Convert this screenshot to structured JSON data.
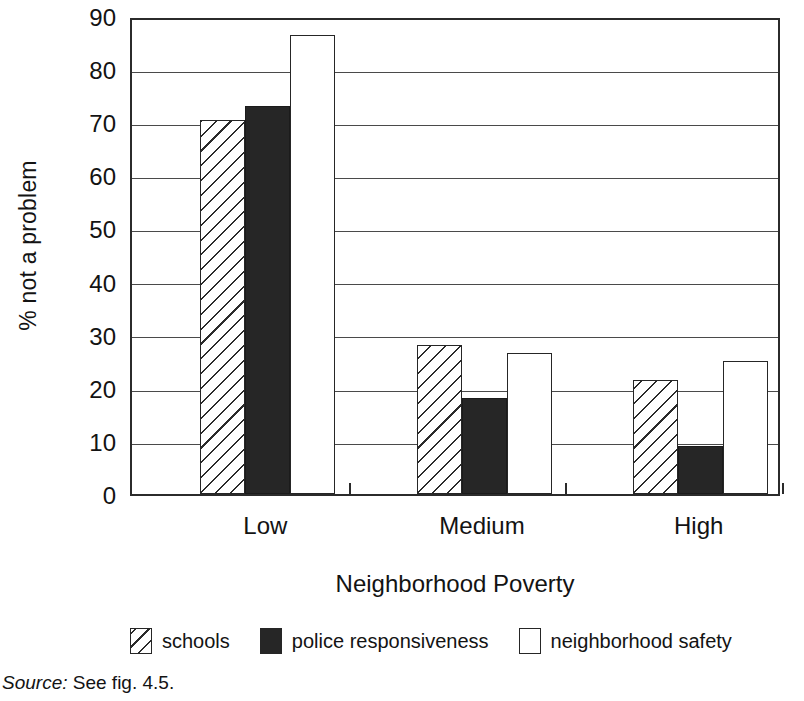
{
  "figure": {
    "source_note_label": "Source:",
    "source_note_text": "See fig. 4.5."
  },
  "chart_data": {
    "type": "bar",
    "title": "",
    "subtitle": "",
    "xlabel": "Neighborhood Poverty",
    "ylabel": "% not a problem",
    "categories": [
      "Low",
      "Medium",
      "High"
    ],
    "series": [
      {
        "name": "schools",
        "fill": "hatch",
        "values": [
          70.5,
          28.0,
          21.5
        ]
      },
      {
        "name": "police responsiveness",
        "fill": "solid",
        "values": [
          73.0,
          18.0,
          9.0
        ]
      },
      {
        "name": "neighborhood safety",
        "fill": "open",
        "values": [
          86.5,
          26.5,
          25.0
        ]
      }
    ],
    "ylim": [
      0,
      90
    ],
    "yticks": [
      0,
      10,
      20,
      30,
      40,
      50,
      60,
      70,
      80,
      90
    ],
    "ytick_labels": [
      "0",
      "10",
      "20",
      "30",
      "40",
      "50",
      "60",
      "70",
      "80",
      "90"
    ],
    "grid": true,
    "grid_axis": "y",
    "legend_position": "bottom",
    "colors": {
      "axis": "#2b2b2b",
      "gridline": "#4a4a4a",
      "solid_fill": "#262626",
      "open_fill": "#ffffff",
      "background": "#ffffff"
    }
  }
}
